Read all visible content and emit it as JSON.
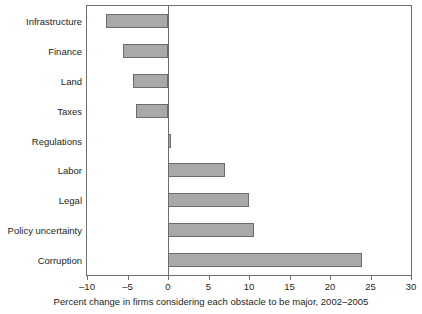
{
  "chart_data": {
    "type": "bar",
    "orientation": "horizontal",
    "title": "",
    "subtitle": "",
    "xlabel": "Percent change in firms considering each obstacle to be major, 2002–2005",
    "ylabel": "",
    "categories": [
      "Infrastructure",
      "Finance",
      "Land",
      "Taxes",
      "Regulations",
      "Labor",
      "Legal",
      "Policy uncertainty",
      "Corruption"
    ],
    "values": [
      -7.7,
      -5.5,
      -4.3,
      -3.9,
      0.4,
      7.0,
      10.0,
      10.6,
      24.0
    ],
    "xlim": [
      -10,
      30
    ],
    "xticks": [
      -10,
      -5,
      0,
      5,
      10,
      15,
      20,
      25,
      30
    ],
    "xtick_labels": [
      "–10",
      "–5",
      "0",
      "5",
      "10",
      "15",
      "20",
      "25",
      "30"
    ],
    "grid": false,
    "legend": null,
    "legend_position": "none",
    "series": [
      {
        "name": "Percent change",
        "values": [
          -7.7,
          -5.5,
          -4.3,
          -3.9,
          0.4,
          7.0,
          10.0,
          10.6,
          24.0
        ]
      }
    ],
    "colors": {
      "bar_fill": "#a9a9a9",
      "bar_stroke": "#6c6c6c",
      "axis": "#6f6f6f",
      "text": "#231f20",
      "background": "#ffffff"
    }
  }
}
